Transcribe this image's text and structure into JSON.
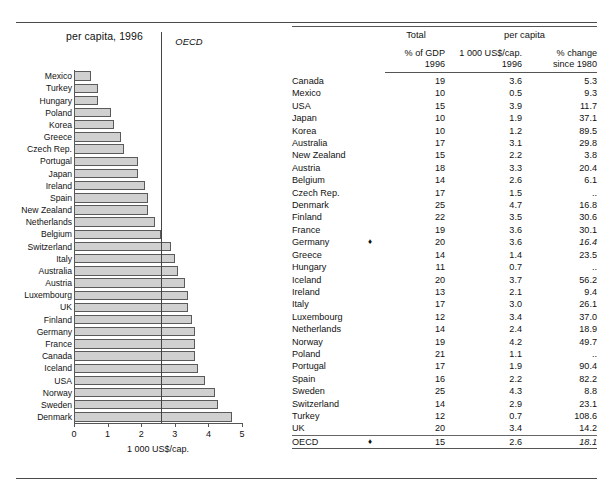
{
  "chart_panel": {
    "title": "per capita, 1996",
    "axis_caption": "1 000 US$/cap.",
    "reference_label": "OECD",
    "reference_value": 2.6,
    "tick_labels": [
      "0",
      "1",
      "2",
      "3",
      "4",
      "5"
    ]
  },
  "chart_data": {
    "type": "bar",
    "orientation": "horizontal",
    "title": "per capita, 1996",
    "xlabel": "1 000 US$/cap.",
    "ylabel": "",
    "xlim": [
      0,
      5
    ],
    "xticks": [
      0,
      1,
      2,
      3,
      4,
      5
    ],
    "grid": false,
    "legend": "none",
    "annotations": [
      {
        "label": "OECD",
        "type": "vertical-reference-line",
        "value": 2.6
      }
    ],
    "categories": [
      "Mexico",
      "Turkey",
      "Hungary",
      "Poland",
      "Korea",
      "Greece",
      "Czech Rep.",
      "Portugal",
      "Japan",
      "Ireland",
      "Spain",
      "New Zealand",
      "Netherlands",
      "Belgium",
      "Switzerland",
      "Italy",
      "Australia",
      "Austria",
      "Luxembourg",
      "UK",
      "Finland",
      "Germany",
      "France",
      "Canada",
      "Iceland",
      "USA",
      "Norway",
      "Sweden",
      "Denmark"
    ],
    "values": [
      0.5,
      0.7,
      0.7,
      1.1,
      1.2,
      1.4,
      1.5,
      1.9,
      1.9,
      2.1,
      2.2,
      2.2,
      2.4,
      2.6,
      2.9,
      3.0,
      3.1,
      3.3,
      3.4,
      3.4,
      3.5,
      3.6,
      3.6,
      3.6,
      3.7,
      3.9,
      4.2,
      4.3,
      4.7
    ]
  },
  "table": {
    "group_headers": {
      "total": "Total",
      "per_capita": "per capita"
    },
    "columns": [
      {
        "key": "country",
        "label": ""
      },
      {
        "key": "gdp",
        "label": "% of GDP",
        "sub": "1996"
      },
      {
        "key": "usd",
        "label": "1 000 US$/cap.",
        "sub": "1996"
      },
      {
        "key": "change",
        "label": "% change",
        "sub": "since 1980"
      }
    ],
    "column_headers": {
      "gdp": "% of GDP\n1996",
      "gdp_line1": "% of GDP",
      "gdp_line2": "1996",
      "usd_line1": "1 000 US$/cap.",
      "usd_line2": "1996",
      "chg_line1": "% change",
      "chg_line2": "since 1980"
    },
    "rows": [
      {
        "country": "Canada",
        "mark": "",
        "gdp": "19",
        "usd": "3.6",
        "change": "5.3"
      },
      {
        "country": "Mexico",
        "mark": "",
        "gdp": "10",
        "usd": "0.5",
        "change": "9.3"
      },
      {
        "country": "USA",
        "mark": "",
        "gdp": "15",
        "usd": "3.9",
        "change": "11.7"
      },
      {
        "country": "Japan",
        "mark": "",
        "gdp": "10",
        "usd": "1.9",
        "change": "37.1"
      },
      {
        "country": "Korea",
        "mark": "",
        "gdp": "10",
        "usd": "1.2",
        "change": "89.5"
      },
      {
        "country": "Australia",
        "mark": "",
        "gdp": "17",
        "usd": "3.1",
        "change": "29.8"
      },
      {
        "country": "New Zealand",
        "mark": "",
        "gdp": "15",
        "usd": "2.2",
        "change": "3.8"
      },
      {
        "country": "Austria",
        "mark": "",
        "gdp": "18",
        "usd": "3.3",
        "change": "20.4"
      },
      {
        "country": "Belgium",
        "mark": "",
        "gdp": "14",
        "usd": "2.6",
        "change": "6.1"
      },
      {
        "country": "Czech Rep.",
        "mark": "",
        "gdp": "17",
        "usd": "1.5",
        "change": ".."
      },
      {
        "country": "Denmark",
        "mark": "",
        "gdp": "25",
        "usd": "4.7",
        "change": "16.8"
      },
      {
        "country": "Finland",
        "mark": "",
        "gdp": "22",
        "usd": "3.5",
        "change": "30.6"
      },
      {
        "country": "France",
        "mark": "",
        "gdp": "19",
        "usd": "3.6",
        "change": "30.1"
      },
      {
        "country": "Germany",
        "mark": "♦",
        "gdp": "20",
        "usd": "3.6",
        "change": "16.4"
      },
      {
        "country": "Greece",
        "mark": "",
        "gdp": "14",
        "usd": "1.4",
        "change": "23.5"
      },
      {
        "country": "Hungary",
        "mark": "",
        "gdp": "11",
        "usd": "0.7",
        "change": ".."
      },
      {
        "country": "Iceland",
        "mark": "",
        "gdp": "20",
        "usd": "3.7",
        "change": "56.2"
      },
      {
        "country": "Ireland",
        "mark": "",
        "gdp": "13",
        "usd": "2.1",
        "change": "9.4"
      },
      {
        "country": "Italy",
        "mark": "",
        "gdp": "17",
        "usd": "3.0",
        "change": "26.1"
      },
      {
        "country": "Luxembourg",
        "mark": "",
        "gdp": "12",
        "usd": "3.4",
        "change": "37.0"
      },
      {
        "country": "Netherlands",
        "mark": "",
        "gdp": "14",
        "usd": "2.4",
        "change": "18.9"
      },
      {
        "country": "Norway",
        "mark": "",
        "gdp": "19",
        "usd": "4.2",
        "change": "49.7"
      },
      {
        "country": "Poland",
        "mark": "",
        "gdp": "21",
        "usd": "1.1",
        "change": ".."
      },
      {
        "country": "Portugal",
        "mark": "",
        "gdp": "17",
        "usd": "1.9",
        "change": "90.4"
      },
      {
        "country": "Spain",
        "mark": "",
        "gdp": "16",
        "usd": "2.2",
        "change": "82.2"
      },
      {
        "country": "Sweden",
        "mark": "",
        "gdp": "25",
        "usd": "4.3",
        "change": "8.8"
      },
      {
        "country": "Switzerland",
        "mark": "",
        "gdp": "14",
        "usd": "2.9",
        "change": "23.1"
      },
      {
        "country": "Turkey",
        "mark": "",
        "gdp": "12",
        "usd": "0.7",
        "change": "108.6"
      },
      {
        "country": "UK",
        "mark": "",
        "gdp": "20",
        "usd": "3.4",
        "change": "14.2"
      }
    ],
    "total_row": {
      "country": "OECD",
      "mark": "♦",
      "gdp": "15",
      "usd": "2.6",
      "change": "18.1"
    },
    "footnote": {
      "marker": "♦",
      "text": "See Technical Annex for data sources, notes and comments."
    }
  },
  "colors": {
    "bar_fill": "#d0d0d0",
    "bar_stroke": "#5a5a5a",
    "rule": "#4a4a4a",
    "text": "#111111"
  }
}
